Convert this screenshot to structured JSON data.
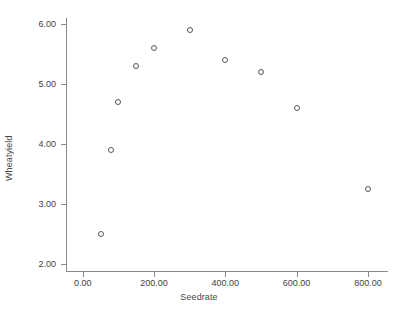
{
  "chart_data": {
    "type": "scatter",
    "title": "",
    "xlabel": "Seedrate",
    "ylabel": "Wheatyield",
    "x": [
      50,
      80,
      100,
      150,
      200,
      300,
      400,
      500,
      600,
      800
    ],
    "values": [
      2.5,
      3.9,
      4.7,
      5.3,
      5.6,
      5.9,
      5.4,
      5.2,
      4.6,
      3.25
    ],
    "points": [
      {
        "x": 50,
        "y": 2.5
      },
      {
        "x": 80,
        "y": 3.9
      },
      {
        "x": 100,
        "y": 4.7
      },
      {
        "x": 150,
        "y": 5.3
      },
      {
        "x": 200,
        "y": 5.6
      },
      {
        "x": 300,
        "y": 5.9
      },
      {
        "x": 400,
        "y": 5.4
      },
      {
        "x": 500,
        "y": 5.2
      },
      {
        "x": 600,
        "y": 4.6
      },
      {
        "x": 800,
        "y": 3.25
      }
    ],
    "xlim": [
      0,
      860
    ],
    "ylim": [
      2.0,
      6.0
    ],
    "xticks": [
      0,
      200,
      400,
      600,
      800
    ],
    "xticklabels": [
      "0.00",
      "200.00",
      "400.00",
      "600.00",
      "800.00"
    ],
    "yticks": [
      2.0,
      3.0,
      4.0,
      5.0,
      6.0
    ],
    "yticklabels": [
      "2.00",
      "3.00",
      "4.00",
      "5.00",
      "6.00"
    ],
    "grid": false,
    "legend": null,
    "marker": "open-circle",
    "marker_color": "#575757",
    "axis_color": "#8a8a8a",
    "background": "#ffffff"
  }
}
